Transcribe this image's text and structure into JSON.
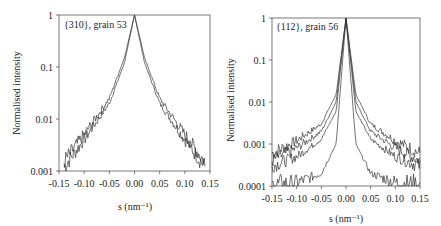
{
  "chart_data": [
    {
      "type": "line",
      "annotation": "{310}, grain 53",
      "xlabel": "s (nm⁻¹)",
      "ylabel": "Normalised intensity",
      "xlim": [
        -0.15,
        0.15
      ],
      "ylim": [
        0.001,
        1
      ],
      "yscale": "log",
      "xticks": [
        "-0.15",
        "-0.10",
        "-0.05",
        "0.00",
        "0.05",
        "0.10",
        "0.15"
      ],
      "yticks": [
        "1",
        "0.1",
        "0.01",
        "0.001"
      ],
      "grid": false,
      "legend": null,
      "series": [
        {
          "name": "profile 1",
          "x": [
            -0.14,
            -0.1,
            -0.05,
            -0.02,
            0.0,
            0.02,
            0.05,
            0.1,
            0.14
          ],
          "y": [
            0.0012,
            0.004,
            0.02,
            0.12,
            1,
            0.12,
            0.02,
            0.004,
            0.0012
          ]
        },
        {
          "name": "profile 2",
          "x": [
            -0.14,
            -0.1,
            -0.05,
            -0.02,
            0.0,
            0.02,
            0.05,
            0.1,
            0.14
          ],
          "y": [
            0.0015,
            0.005,
            0.025,
            0.15,
            1,
            0.15,
            0.025,
            0.005,
            0.0015
          ]
        }
      ]
    },
    {
      "type": "line",
      "annotation": "{112}, grain 56",
      "xlabel": "s (nm⁻¹)",
      "ylabel": "Normalised intensity",
      "xlim": [
        -0.15,
        0.15
      ],
      "ylim": [
        0.0001,
        1
      ],
      "yscale": "log",
      "xticks": [
        "-0.15",
        "-0.10",
        "-0.05",
        "0.00",
        "0.05",
        "0.10",
        "0.15"
      ],
      "yticks": [
        "1",
        "0.1",
        "0.01",
        "0.001",
        "0.0001"
      ],
      "grid": false,
      "legend": null,
      "series": [
        {
          "name": "profile 1",
          "x": [
            -0.15,
            -0.1,
            -0.05,
            -0.02,
            0.0,
            0.02,
            0.05,
            0.1,
            0.15
          ],
          "y": [
            0.0006,
            0.0012,
            0.003,
            0.015,
            1,
            0.015,
            0.003,
            0.0012,
            0.0006
          ]
        },
        {
          "name": "profile 2",
          "x": [
            -0.15,
            -0.1,
            -0.05,
            -0.02,
            0.0,
            0.02,
            0.05,
            0.1,
            0.15
          ],
          "y": [
            0.0004,
            0.0008,
            0.002,
            0.01,
            1,
            0.01,
            0.002,
            0.0008,
            0.0004
          ]
        },
        {
          "name": "profile 3",
          "x": [
            -0.15,
            -0.1,
            -0.05,
            -0.02,
            0.0,
            0.02,
            0.05,
            0.1,
            0.15
          ],
          "y": [
            0.0003,
            0.0005,
            0.0013,
            0.006,
            1,
            0.006,
            0.0013,
            0.0005,
            0.0003
          ]
        },
        {
          "name": "profile 4",
          "x": [
            -0.15,
            -0.1,
            -0.05,
            -0.02,
            0.0,
            0.02,
            0.05,
            0.1,
            0.15
          ],
          "y": [
            0.0001,
            0.00012,
            0.0002,
            0.001,
            1,
            0.001,
            0.0002,
            0.00012,
            0.0001
          ]
        }
      ]
    }
  ]
}
